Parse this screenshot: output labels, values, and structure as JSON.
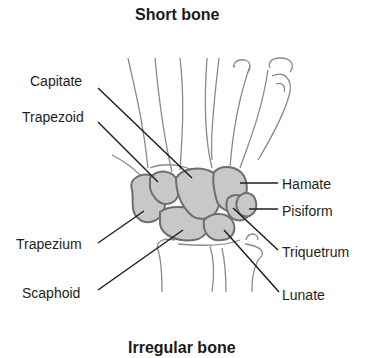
{
  "diagram": {
    "title_top": "Short bone",
    "title_bottom": "Irregular bone",
    "colors": {
      "bone_fill": "#c8c8c8",
      "bone_outline": "#6e6e6e",
      "sketch_line": "#8a8a8a",
      "leader_line": "#1e1e1e",
      "background": "#ffffff"
    },
    "labels_left": [
      {
        "text": "Capitate"
      },
      {
        "text": "Trapezoid"
      },
      {
        "text": "Trapezium"
      },
      {
        "text": "Scaphoid"
      }
    ],
    "labels_right": [
      {
        "text": "Hamate"
      },
      {
        "text": "Pisiform"
      },
      {
        "text": "Triquetrum"
      },
      {
        "text": "Lunate"
      }
    ]
  }
}
